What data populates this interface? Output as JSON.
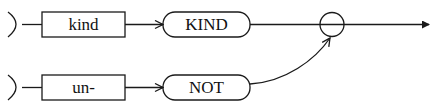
{
  "diagram": {
    "type": "flow",
    "colors": {
      "stroke": "#1a1a1a",
      "background": "#ffffff"
    },
    "rows": [
      {
        "input_box": {
          "label": "kind"
        },
        "output_pill": {
          "label": "KIND"
        }
      },
      {
        "input_box": {
          "label": "un-"
        },
        "output_pill": {
          "label": "NOT"
        }
      }
    ],
    "junction": {
      "shape": "circle"
    },
    "edges": [
      {
        "from": "kind",
        "to": "KIND"
      },
      {
        "from": "un-",
        "to": "NOT"
      },
      {
        "from": "KIND",
        "to": "junction"
      },
      {
        "from": "NOT",
        "to": "junction"
      },
      {
        "from": "junction",
        "to": "output"
      }
    ]
  }
}
